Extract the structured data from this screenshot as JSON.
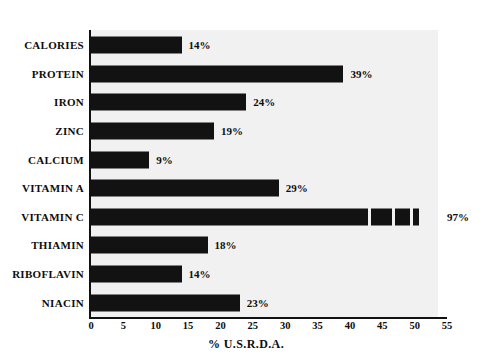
{
  "chart_data": {
    "type": "bar",
    "orientation": "horizontal",
    "title": "",
    "subtitle": "",
    "xlabel": "% U.S.R.D.A.",
    "ylabel": "",
    "xlim": [
      0,
      55
    ],
    "xticks": [
      0,
      5,
      10,
      15,
      20,
      25,
      30,
      35,
      40,
      45,
      50,
      55
    ],
    "xticklabels": [
      "0",
      "5",
      "10",
      "15",
      "20",
      "25",
      "30",
      "35",
      "40",
      "45",
      "50",
      "55"
    ],
    "grid": false,
    "legend": null,
    "bar_color": "#121212",
    "plot_background": "#f1f1f1",
    "page_background": "#ffffff",
    "categories": [
      "CALORIES",
      "PROTEIN",
      "IRON",
      "ZINC",
      "CALCIUM",
      "VITAMIN A",
      "VITAMIN C",
      "THIAMIN",
      "RIBOFLAVIN",
      "NIACIN"
    ],
    "values": [
      14,
      39,
      24,
      19,
      9,
      29,
      97,
      18,
      14,
      23
    ],
    "data_labels": [
      "14%",
      "39%",
      "24%",
      "19%",
      "9%",
      "29%",
      "97%",
      "18%",
      "14%",
      "23%"
    ],
    "bars": [
      {
        "category": "CALORIES",
        "value": 14,
        "label": "14%",
        "truncated": false
      },
      {
        "category": "PROTEIN",
        "value": 39,
        "label": "39%",
        "truncated": false
      },
      {
        "category": "IRON",
        "value": 24,
        "label": "24%",
        "truncated": false
      },
      {
        "category": "ZINC",
        "value": 19,
        "label": "19%",
        "truncated": false
      },
      {
        "category": "CALCIUM",
        "value": 9,
        "label": "9%",
        "truncated": false
      },
      {
        "category": "VITAMIN A",
        "value": 29,
        "label": "29%",
        "truncated": false
      },
      {
        "category": "VITAMIN C",
        "value": 97,
        "label": "97%",
        "truncated": true
      },
      {
        "category": "THIAMIN",
        "value": 18,
        "label": "18%",
        "truncated": false
      },
      {
        "category": "RIBOFLAVIN",
        "value": 14,
        "label": "14%",
        "truncated": false
      },
      {
        "category": "NIACIN",
        "value": 23,
        "label": "23%",
        "truncated": false
      }
    ]
  }
}
